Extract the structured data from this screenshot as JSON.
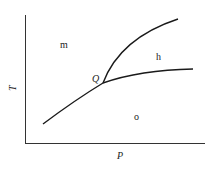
{
  "diagram": {
    "type": "phase-diagram",
    "axes": {
      "x_label": "P",
      "y_label": "T"
    },
    "regions": [
      {
        "id": "m",
        "label": "m"
      },
      {
        "id": "h",
        "label": "h"
      },
      {
        "id": "o",
        "label": "o"
      }
    ],
    "points": [
      {
        "id": "Q",
        "label": "Q",
        "description": "triple point where phase boundaries meet"
      }
    ],
    "curves": [
      {
        "id": "boundary-m-o",
        "description": "lower-left boundary rising to Q"
      },
      {
        "id": "boundary-h-o",
        "description": "boundary from Q extending right, gently rising"
      },
      {
        "id": "boundary-m-h",
        "description": "boundary from Q rising steeply up and right"
      }
    ],
    "colors": {
      "line": "#1a1a1a",
      "background": "#ffffff"
    }
  }
}
